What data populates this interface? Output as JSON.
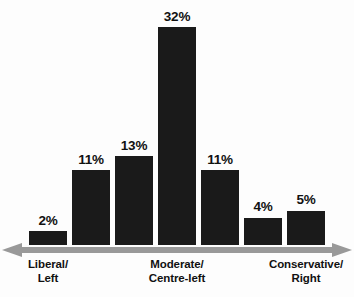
{
  "chart_data": {
    "type": "bar",
    "title": "",
    "subtitle": "",
    "xlabel": "",
    "ylabel": "",
    "grid": false,
    "legend": false,
    "ylim": [
      0,
      32
    ],
    "categories": [
      "1",
      "2",
      "3",
      "4",
      "5",
      "6",
      "7"
    ],
    "values": [
      2,
      11,
      13,
      32,
      11,
      4,
      5
    ],
    "value_labels": [
      "2%",
      "11%",
      "13%",
      "32%",
      "11%",
      "4%",
      "5%"
    ],
    "axis_tick_labels": [
      {
        "at_bar": 1,
        "line1": "Liberal/",
        "line2": "Left"
      },
      {
        "at_bar": 4,
        "line1": "Moderate/",
        "line2": "Centre-left"
      },
      {
        "at_bar": 7,
        "line1": "Conservative/",
        "line2": "Right"
      }
    ],
    "bar_color": "#1a1a1a",
    "axis_color": "#999999",
    "background_color": "#fdfdfd",
    "text_color": "#111111",
    "axis_style": "double-headed-arrow"
  },
  "bars": [
    {
      "value_label": "2%",
      "value": 2
    },
    {
      "value_label": "11%",
      "value": 11
    },
    {
      "value_label": "13%",
      "value": 13
    },
    {
      "value_label": "32%",
      "value": 32
    },
    {
      "value_label": "11%",
      "value": 11
    },
    {
      "value_label": "4%",
      "value": 4
    },
    {
      "value_label": "5%",
      "value": 5
    }
  ],
  "labels": {
    "left": {
      "line1": "Liberal/",
      "line2": "Left"
    },
    "center": {
      "line1": "Moderate/",
      "line2": "Centre-left"
    },
    "right": {
      "line1": "Conservative/",
      "line2": "Right"
    }
  }
}
